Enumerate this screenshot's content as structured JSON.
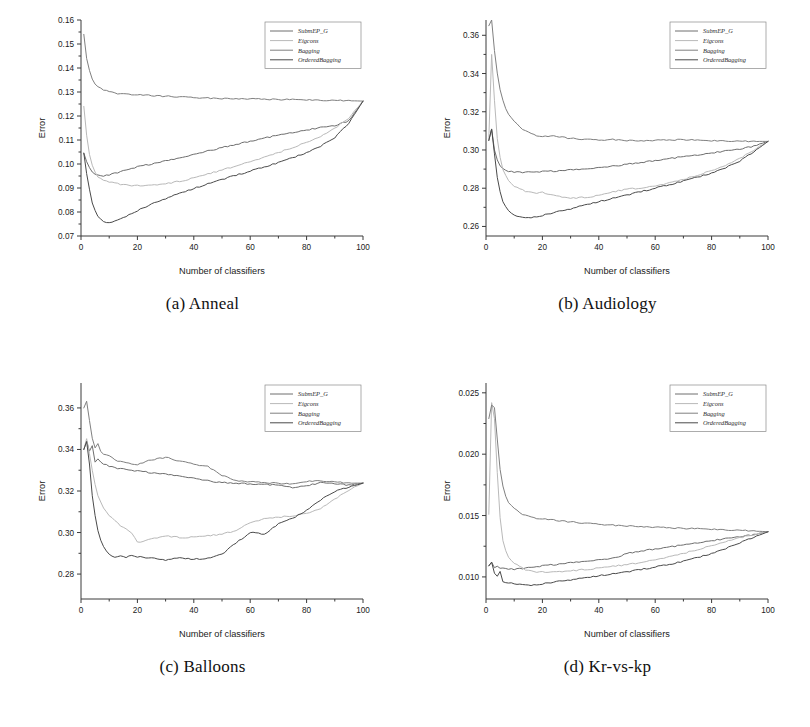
{
  "figure": {
    "axis_x_label": "Number of classifiers",
    "axis_y_label": "Error",
    "legend_entries": [
      "SubmEP_G",
      "Eigcons",
      "Bagging",
      "OrderedBagging"
    ],
    "series_colors": {
      "SubmEP_G": "#6e6e6e",
      "Eigcons": "#b9b9b9",
      "Bagging": "#808080",
      "OrderedBagging": "#4a4a4a"
    }
  },
  "panels": [
    {
      "caption": "(a) Anneal"
    },
    {
      "caption": "(b) Audiology"
    },
    {
      "caption": "(c) Balloons"
    },
    {
      "caption": "(d) Kr-vs-kp"
    }
  ],
  "chart_data": [
    {
      "type": "line",
      "title": "(a) Anneal",
      "xlabel": "Number of classifiers",
      "ylabel": "Error",
      "xlim": [
        0,
        100
      ],
      "ylim": [
        0.07,
        0.16
      ],
      "xticks": [
        0,
        20,
        40,
        60,
        80,
        100
      ],
      "yticks": [
        0.07,
        0.08,
        0.09,
        0.1,
        0.11,
        0.12,
        0.13,
        0.14,
        0.15,
        0.16
      ],
      "grid": false,
      "legend_position": "top-right",
      "x": [
        1,
        2,
        3,
        4,
        5,
        6,
        7,
        8,
        9,
        10,
        12,
        14,
        16,
        18,
        20,
        25,
        30,
        35,
        40,
        45,
        50,
        55,
        60,
        65,
        70,
        75,
        80,
        85,
        90,
        95,
        100
      ],
      "series": [
        {
          "name": "SubmEP_G",
          "values": [
            0.1045,
            0.101,
            0.0985,
            0.0968,
            0.0958,
            0.0952,
            0.095,
            0.095,
            0.0952,
            0.0955,
            0.0962,
            0.0968,
            0.0975,
            0.0982,
            0.0988,
            0.1,
            0.1012,
            0.1025,
            0.104,
            0.1055,
            0.1068,
            0.1082,
            0.1095,
            0.1108,
            0.112,
            0.1132,
            0.1142,
            0.1152,
            0.116,
            0.118,
            0.1262
          ]
        },
        {
          "name": "Eigcons",
          "values": [
            0.124,
            0.112,
            0.104,
            0.0995,
            0.0965,
            0.0948,
            0.0938,
            0.0932,
            0.0928,
            0.0925,
            0.092,
            0.0916,
            0.0913,
            0.0911,
            0.091,
            0.0912,
            0.0918,
            0.0928,
            0.0942,
            0.0958,
            0.0975,
            0.0992,
            0.101,
            0.1028,
            0.1048,
            0.1068,
            0.109,
            0.1115,
            0.1148,
            0.1192,
            0.1262
          ]
        },
        {
          "name": "Bagging",
          "values": [
            0.154,
            0.144,
            0.139,
            0.1352,
            0.1335,
            0.1322,
            0.1318,
            0.131,
            0.1305,
            0.13,
            0.1296,
            0.1292,
            0.1292,
            0.129,
            0.1288,
            0.1285,
            0.1282,
            0.128,
            0.1277,
            0.1275,
            0.1273,
            0.1272,
            0.1271,
            0.127,
            0.1269,
            0.1268,
            0.1267,
            0.1266,
            0.1265,
            0.1264,
            0.1262
          ]
        },
        {
          "name": "OrderedBagging",
          "values": [
            0.1045,
            0.096,
            0.0895,
            0.084,
            0.0805,
            0.0782,
            0.0768,
            0.0758,
            0.0755,
            0.0756,
            0.0762,
            0.0772,
            0.0783,
            0.0795,
            0.0806,
            0.0832,
            0.0856,
            0.0878,
            0.0898,
            0.0918,
            0.0936,
            0.0953,
            0.097,
            0.0988,
            0.1006,
            0.1026,
            0.1048,
            0.1075,
            0.111,
            0.117,
            0.1262
          ]
        }
      ]
    },
    {
      "type": "line",
      "title": "(b) Audiology",
      "xlabel": "Number of classifiers",
      "ylabel": "Error",
      "xlim": [
        0,
        100
      ],
      "ylim": [
        0.255,
        0.368
      ],
      "xticks": [
        0,
        20,
        40,
        60,
        80,
        100
      ],
      "yticks": [
        0.26,
        0.28,
        0.3,
        0.32,
        0.34,
        0.36
      ],
      "grid": false,
      "legend_position": "top-right",
      "x": [
        1,
        2,
        3,
        4,
        5,
        6,
        7,
        8,
        9,
        10,
        12,
        14,
        16,
        18,
        20,
        25,
        30,
        35,
        40,
        45,
        50,
        55,
        60,
        65,
        70,
        75,
        80,
        85,
        90,
        95,
        100
      ],
      "series": [
        {
          "name": "SubmEP_G",
          "values": [
            0.305,
            0.311,
            0.3,
            0.295,
            0.2918,
            0.29,
            0.2892,
            0.2888,
            0.2886,
            0.2885,
            0.2884,
            0.2884,
            0.2885,
            0.2886,
            0.2887,
            0.289,
            0.2895,
            0.29,
            0.2908,
            0.2916,
            0.2925,
            0.2935,
            0.2945,
            0.2955,
            0.2965,
            0.2975,
            0.2985,
            0.2995,
            0.3005,
            0.302,
            0.3045
          ]
        },
        {
          "name": "Eigcons",
          "values": [
            0.306,
            0.35,
            0.326,
            0.306,
            0.296,
            0.29,
            0.2865,
            0.284,
            0.2822,
            0.281,
            0.2795,
            0.2785,
            0.2778,
            0.2776,
            0.2778,
            0.276,
            0.2748,
            0.2752,
            0.2762,
            0.278,
            0.2796,
            0.28,
            0.2812,
            0.2828,
            0.2846,
            0.2868,
            0.2892,
            0.292,
            0.2955,
            0.3,
            0.3045
          ]
        },
        {
          "name": "Bagging",
          "values": [
            0.365,
            0.368,
            0.352,
            0.34,
            0.3318,
            0.326,
            0.3218,
            0.319,
            0.3166,
            0.3148,
            0.312,
            0.31,
            0.3086,
            0.3076,
            0.307,
            0.3072,
            0.306,
            0.3056,
            0.3052,
            0.3055,
            0.305,
            0.3048,
            0.305,
            0.3052,
            0.3055,
            0.305,
            0.3048,
            0.3048,
            0.3046,
            0.3045,
            0.3045
          ]
        },
        {
          "name": "OrderedBagging",
          "values": [
            0.305,
            0.311,
            0.298,
            0.286,
            0.278,
            0.273,
            0.27,
            0.268,
            0.2668,
            0.266,
            0.265,
            0.2646,
            0.2648,
            0.2652,
            0.2658,
            0.2675,
            0.2692,
            0.2712,
            0.273,
            0.2748,
            0.2765,
            0.2782,
            0.28,
            0.2818,
            0.2838,
            0.2858,
            0.288,
            0.2908,
            0.2942,
            0.299,
            0.3045
          ]
        }
      ]
    },
    {
      "type": "line",
      "title": "(c) Balloons",
      "xlabel": "Number of classifiers",
      "ylabel": "Error",
      "xlim": [
        0,
        100
      ],
      "ylim": [
        0.268,
        0.372
      ],
      "xticks": [
        0,
        20,
        40,
        60,
        80,
        100
      ],
      "yticks": [
        0.28,
        0.3,
        0.32,
        0.34,
        0.36
      ],
      "grid": false,
      "legend_position": "top-right",
      "x": [
        1,
        2,
        3,
        4,
        5,
        6,
        7,
        8,
        9,
        10,
        12,
        14,
        16,
        18,
        20,
        25,
        30,
        35,
        40,
        45,
        50,
        55,
        60,
        65,
        70,
        75,
        80,
        85,
        90,
        95,
        100
      ],
      "series": [
        {
          "name": "SubmEP_G",
          "values": [
            0.34,
            0.344,
            0.3392,
            0.342,
            0.334,
            0.3352,
            0.3338,
            0.333,
            0.3325,
            0.332,
            0.3312,
            0.3308,
            0.3304,
            0.33,
            0.3296,
            0.3288,
            0.328,
            0.3272,
            0.3262,
            0.325,
            0.324,
            0.3238,
            0.3234,
            0.3232,
            0.3228,
            0.3218,
            0.3226,
            0.324,
            0.3236,
            0.3228,
            0.3238
          ]
        },
        {
          "name": "Eigcons",
          "values": [
            0.34,
            0.3452,
            0.338,
            0.33,
            0.323,
            0.318,
            0.3145,
            0.3118,
            0.3098,
            0.3082,
            0.3056,
            0.3034,
            0.3016,
            0.3,
            0.2952,
            0.297,
            0.2984,
            0.2976,
            0.2978,
            0.2984,
            0.2992,
            0.301,
            0.3048,
            0.3066,
            0.3074,
            0.308,
            0.3092,
            0.3116,
            0.316,
            0.3205,
            0.3238
          ]
        },
        {
          "name": "Bagging",
          "values": [
            0.36,
            0.3632,
            0.354,
            0.3452,
            0.341,
            0.3428,
            0.3392,
            0.338,
            0.3372,
            0.3368,
            0.335,
            0.3342,
            0.3336,
            0.3332,
            0.3326,
            0.335,
            0.3362,
            0.3344,
            0.333,
            0.3318,
            0.3276,
            0.325,
            0.3244,
            0.324,
            0.3238,
            0.3232,
            0.3246,
            0.325,
            0.3244,
            0.3238,
            0.3238
          ]
        },
        {
          "name": "OrderedBagging",
          "values": [
            0.34,
            0.3438,
            0.333,
            0.318,
            0.308,
            0.301,
            0.296,
            0.293,
            0.291,
            0.2896,
            0.288,
            0.2888,
            0.2882,
            0.2892,
            0.2884,
            0.2876,
            0.2868,
            0.2878,
            0.2872,
            0.2876,
            0.2896,
            0.295,
            0.3,
            0.2992,
            0.3042,
            0.3068,
            0.3108,
            0.3158,
            0.3198,
            0.3218,
            0.3238
          ]
        }
      ]
    },
    {
      "type": "line",
      "title": "(d) Kr-vs-kp",
      "xlabel": "Number of classifiers",
      "ylabel": "Error",
      "xlim": [
        0,
        100
      ],
      "ylim": [
        0.0082,
        0.0258
      ],
      "xticks": [
        0,
        20,
        40,
        60,
        80,
        100
      ],
      "yticks": [
        0.01,
        0.015,
        0.02,
        0.025
      ],
      "grid": false,
      "legend_position": "top-right",
      "x": [
        1,
        2,
        3,
        4,
        5,
        6,
        7,
        8,
        9,
        10,
        12,
        14,
        16,
        18,
        20,
        25,
        30,
        35,
        40,
        45,
        50,
        55,
        60,
        65,
        70,
        75,
        80,
        85,
        90,
        95,
        100
      ],
      "series": [
        {
          "name": "SubmEP_G",
          "values": [
            0.0109,
            0.0112,
            0.01075,
            0.0109,
            0.01072,
            0.01068,
            0.01066,
            0.01064,
            0.01063,
            0.01062,
            0.01068,
            0.01072,
            0.01078,
            0.01084,
            0.0109,
            0.01102,
            0.01114,
            0.01126,
            0.0114,
            0.01152,
            0.0119,
            0.01212,
            0.01228,
            0.01244,
            0.0126,
            0.0128,
            0.01296,
            0.01312,
            0.01328,
            0.01344,
            0.01368
          ]
        },
        {
          "name": "Eigcons",
          "values": [
            0.0151,
            0.0242,
            0.0229,
            0.0185,
            0.0148,
            0.013,
            0.0121,
            0.0116,
            0.0113,
            0.01112,
            0.01082,
            0.0106,
            0.01048,
            0.01042,
            0.0104,
            0.01042,
            0.0105,
            0.0106,
            0.01072,
            0.01086,
            0.011,
            0.01118,
            0.0114,
            0.01164,
            0.01192,
            0.01222,
            0.01254,
            0.01288,
            0.01318,
            0.01344,
            0.01368
          ]
        },
        {
          "name": "Bagging",
          "values": [
            0.0229,
            0.024,
            0.0238,
            0.0212,
            0.0188,
            0.0174,
            0.0166,
            0.0161,
            0.01578,
            0.01556,
            0.01522,
            0.01502,
            0.01488,
            0.01478,
            0.01472,
            0.0146,
            0.01448,
            0.01438,
            0.0143,
            0.01422,
            0.01416,
            0.0141,
            0.01404,
            0.014,
            0.01396,
            0.01392,
            0.01388,
            0.01384,
            0.0138,
            0.01374,
            0.01368
          ]
        },
        {
          "name": "OrderedBagging",
          "values": [
            0.0109,
            0.0112,
            0.0103,
            0.0101,
            0.01042,
            0.00962,
            0.00948,
            0.00946,
            0.0095,
            0.00944,
            0.0094,
            0.00936,
            0.00934,
            0.00938,
            0.00944,
            0.0096,
            0.00976,
            0.00992,
            0.0101,
            0.01026,
            0.01042,
            0.0106,
            0.0108,
            0.01102,
            0.01128,
            0.01158,
            0.01192,
            0.01232,
            0.01278,
            0.01322,
            0.01368
          ]
        }
      ]
    }
  ]
}
